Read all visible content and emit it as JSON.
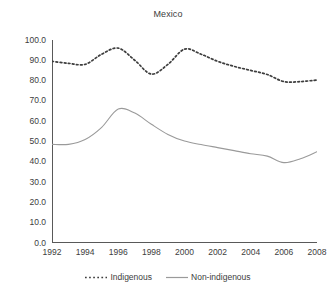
{
  "chart_data": {
    "type": "line",
    "title": "Mexico",
    "xlabel": "",
    "ylabel": "",
    "xlim": [
      1992,
      2008
    ],
    "ylim": [
      0.0,
      100.0
    ],
    "grid": false,
    "legend_position": "bottom",
    "x_tick_labels": [
      "1992",
      "1994",
      "1996",
      "1998",
      "2000",
      "2002",
      "2004",
      "2006",
      "2008"
    ],
    "x_ticks": [
      1992,
      1994,
      1996,
      1998,
      2000,
      2002,
      2004,
      2006,
      2008
    ],
    "y_tick_labels": [
      "0.0",
      "10.0",
      "20.0",
      "30.0",
      "40.0",
      "50.0",
      "60.0",
      "70.0",
      "80.0",
      "90.0",
      "100.0"
    ],
    "y_ticks": [
      0,
      10,
      20,
      30,
      40,
      50,
      60,
      70,
      80,
      90,
      100
    ],
    "x": [
      1992,
      1993,
      1994,
      1995,
      1996,
      1997,
      1998,
      1999,
      2000,
      2001,
      2002,
      2003,
      2004,
      2005,
      2006,
      2007,
      2008
    ],
    "series": [
      {
        "name": "Indigenous",
        "style": "dotted",
        "color": "#3d3d3d",
        "values": [
          89.5,
          88.5,
          88.0,
          93.0,
          96.0,
          90.0,
          83.2,
          88.0,
          95.5,
          93.0,
          89.5,
          87.0,
          85.0,
          83.0,
          79.5,
          79.5,
          80.3
        ]
      },
      {
        "name": "Non-indigenous",
        "style": "solid",
        "color": "#9a9a9a",
        "values": [
          48.6,
          48.6,
          51.0,
          57.0,
          66.0,
          64.0,
          58.5,
          53.5,
          50.2,
          48.5,
          47.0,
          45.5,
          44.0,
          42.8,
          39.6,
          41.5,
          45.0
        ]
      }
    ]
  },
  "legend": {
    "entries": [
      {
        "label": "Indigenous",
        "style": "dotted"
      },
      {
        "label": "Non-indigenous",
        "style": "solid"
      }
    ]
  },
  "colors": {
    "indigenous": "#3d3d3d",
    "non_indigenous": "#9a9a9a",
    "axis": "#595959",
    "text": "#3d3d3d",
    "background": "#ffffff"
  }
}
